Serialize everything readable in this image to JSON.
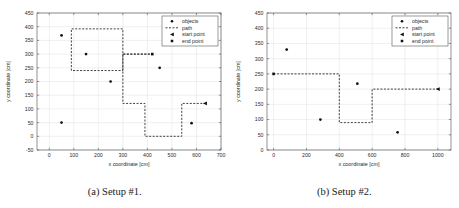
{
  "figure": {
    "panels": [
      {
        "caption": "(a) Setup #1.",
        "chart_data": {
          "type": "scatter",
          "title": "",
          "xlabel": "x coordinate [cm]",
          "ylabel": "y coordinate [cm]",
          "xlim": [
            -50,
            700
          ],
          "ylim": [
            -50,
            450
          ],
          "xticks": [
            0,
            100,
            200,
            300,
            400,
            500,
            600,
            700
          ],
          "yticks": [
            -50,
            0,
            50,
            100,
            150,
            200,
            250,
            300,
            350,
            400,
            450
          ],
          "grid": true,
          "legend": {
            "position": "upper right",
            "entries": [
              "objects",
              "path",
              "start point",
              "end point"
            ]
          },
          "series": [
            {
              "name": "objects",
              "type": "scatter",
              "points": [
                [
                  50,
                  368
                ],
                [
                  150,
                  300
                ],
                [
                  250,
                  200
                ],
                [
                  450,
                  250
                ],
                [
                  580,
                  48
                ],
                [
                  50,
                  50
                ]
              ]
            },
            {
              "name": "path",
              "type": "line",
              "style": "dashed",
              "points": [
                [
                  90,
                  240
                ],
                [
                  90,
                  392
                ],
                [
                  300,
                  392
                ],
                [
                  300,
                  300
                ],
                [
                  420,
                  300
                ],
                [
                  420,
                  300
                ],
                [
                  300,
                  300
                ],
                [
                  300,
                  240
                ],
                [
                  90,
                  240
                ]
              ]
            },
            {
              "name": "path-segment-2",
              "type": "line",
              "style": "dashed",
              "points": [
                [
                  300,
                  300
                ],
                [
                  300,
                  120
                ],
                [
                  390,
                  120
                ],
                [
                  390,
                  0
                ],
                [
                  540,
                  0
                ],
                [
                  540,
                  120
                ],
                [
                  635,
                  120
                ]
              ]
            }
          ],
          "start_point": [
            635,
            120
          ],
          "end_point": [
            420,
            300
          ]
        }
      },
      {
        "caption": "(b) Setup #2.",
        "chart_data": {
          "type": "scatter",
          "title": "",
          "xlabel": "x coordinate [cm]",
          "ylabel": "y coordinate [cm]",
          "xlim": [
            -40,
            1080
          ],
          "ylim": [
            0,
            450
          ],
          "xticks": [
            0,
            200,
            400,
            600,
            800,
            1000
          ],
          "yticks": [
            0,
            50,
            100,
            150,
            200,
            250,
            300,
            350,
            400,
            450
          ],
          "grid": true,
          "legend": {
            "position": "upper right",
            "entries": [
              "objects",
              "path",
              "start point",
              "end point"
            ]
          },
          "series": [
            {
              "name": "objects",
              "type": "scatter",
              "points": [
                [
                  80,
                  330
                ],
                [
                  285,
                  100
                ],
                [
                  510,
                  218
                ],
                [
                  755,
                  58
                ]
              ]
            },
            {
              "name": "path",
              "type": "line",
              "style": "dashed",
              "points": [
                [
                  0,
                  250
                ],
                [
                  400,
                  250
                ],
                [
                  400,
                  90
                ],
                [
                  600,
                  90
                ],
                [
                  600,
                  200
                ],
                [
                  1000,
                  200
                ]
              ]
            }
          ],
          "start_point": [
            1000,
            200
          ],
          "end_point": [
            0,
            250
          ]
        }
      }
    ]
  }
}
